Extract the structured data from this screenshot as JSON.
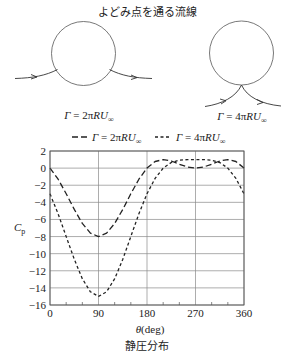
{
  "figure": {
    "top_title": "よどみ点を通る流線",
    "diagrams": [
      {
        "label": {
          "lhs": "Γ",
          "mid": " = 2π",
          "rhs": "RU",
          "sub": "∞"
        }
      },
      {
        "label": {
          "lhs": "Γ",
          "mid": " = 4π",
          "rhs": "RU",
          "sub": "∞"
        }
      }
    ],
    "legend": [
      {
        "lhs": "Γ",
        "mid": " = 2π",
        "rhs": "RU",
        "sub": "∞",
        "style": "long-dash"
      },
      {
        "lhs": "Γ",
        "mid": " = 4π",
        "rhs": "RU",
        "sub": "∞",
        "style": "short-dash"
      }
    ],
    "ylabel": {
      "main": "C",
      "sub": "p"
    },
    "xlabel": {
      "sym": "θ",
      "unit": "(deg)"
    },
    "caption": "静圧分布",
    "colors": {
      "line": "#222222",
      "grid": "#8a8a8a",
      "axis": "#555555",
      "background": "#ffffff"
    }
  },
  "chart_data": {
    "type": "line",
    "title": "静圧分布",
    "xlabel": "θ(deg)",
    "ylabel": "Cp",
    "xlim": [
      0,
      360
    ],
    "ylim": [
      -16,
      2
    ],
    "xticks": [
      0,
      90,
      180,
      270,
      360
    ],
    "xminor_ticks": [
      30,
      60,
      120,
      150,
      210,
      240,
      300,
      330
    ],
    "yticks": [
      2,
      0,
      -2,
      -4,
      -6,
      -8,
      -10,
      -12,
      -14,
      -16
    ],
    "ytick_labels": [
      "2",
      "0",
      "−2",
      "−4",
      "−6",
      "−8",
      "−10",
      "−12",
      "−14",
      "−16"
    ],
    "grid": true,
    "legend_position": "top",
    "x": [
      0,
      15,
      30,
      45,
      60,
      75,
      90,
      105,
      120,
      135,
      150,
      165,
      180,
      195,
      210,
      225,
      240,
      255,
      270,
      285,
      300,
      315,
      330,
      345,
      360
    ],
    "series": [
      {
        "name": "Γ = 2πRU∞",
        "style": "long-dash",
        "values": [
          0,
          -1.3,
          -3.0,
          -4.83,
          -6.46,
          -7.6,
          -8.0,
          -7.6,
          -6.46,
          -4.83,
          -3.0,
          -1.3,
          0,
          0.77,
          1.0,
          0.83,
          0.46,
          0.13,
          0,
          0.13,
          0.46,
          0.83,
          1.0,
          0.77,
          0
        ]
      },
      {
        "name": "Γ = 4πRU∞",
        "style": "short-dash",
        "values": [
          -3.0,
          -5.34,
          -8.0,
          -10.66,
          -12.93,
          -14.46,
          -15.0,
          -14.46,
          -12.93,
          -10.66,
          -8.0,
          -5.34,
          -3.0,
          -1.2,
          0,
          0.66,
          0.93,
          1.0,
          1.0,
          1.0,
          0.93,
          0.66,
          0,
          -1.2,
          -3.0
        ]
      }
    ]
  }
}
